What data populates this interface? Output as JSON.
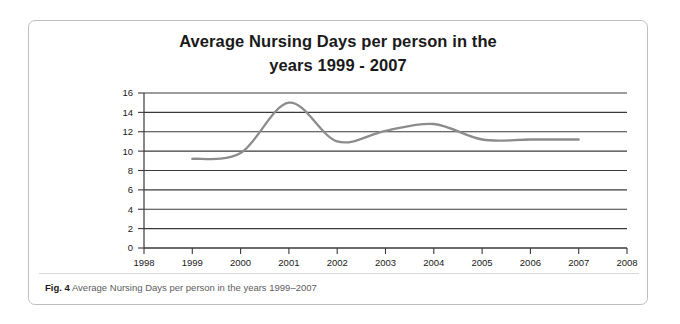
{
  "figure": {
    "title_line_1": "Average Nursing Days per person in the",
    "title_line_2": "years 1999 - 2007",
    "caption_label": "Fig. 4",
    "caption_text": "Average Nursing Days per person in the years 1999–2007",
    "line_color": "#8c8c8c",
    "grid_color": "#3a3a3a",
    "axis_color": "#3a3a3a",
    "border_color": "#bfbfbf"
  },
  "chart_data": {
    "type": "line",
    "title": "Average Nursing Days per person in the years 1999 - 2007",
    "xlabel": "",
    "ylabel": "",
    "xlim": [
      1998,
      2008
    ],
    "ylim": [
      0,
      16
    ],
    "grid": true,
    "legend": "none",
    "x_tick_labels": [
      "1998",
      "1999",
      "2000",
      "2001",
      "2002",
      "2003",
      "2004",
      "2005",
      "2006",
      "2007",
      "2008"
    ],
    "y_tick_labels": [
      "0",
      "2",
      "4",
      "6",
      "8",
      "10",
      "12",
      "14",
      "16"
    ],
    "x": [
      1999,
      2000,
      2001,
      2002,
      2003,
      2004,
      2005,
      2006,
      2007
    ],
    "values": [
      9.2,
      9.8,
      15.0,
      11.0,
      12.1,
      12.8,
      11.2,
      11.2,
      11.2
    ],
    "series": [
      {
        "name": "Average Nursing Days per person",
        "values": [
          9.2,
          9.8,
          15.0,
          11.0,
          12.1,
          12.8,
          11.2,
          11.2,
          11.2
        ]
      }
    ]
  }
}
